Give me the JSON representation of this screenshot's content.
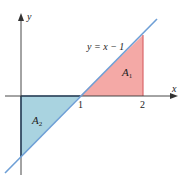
{
  "diagram": {
    "type": "area-under-line",
    "equation_label": "y = x − 1",
    "axes": {
      "x_label": "x",
      "y_label": "y",
      "x_ticks": [
        "1",
        "2"
      ]
    },
    "regions": [
      {
        "name": "A",
        "subscript": "1",
        "color": "#f4a9a6",
        "description": "area above x-axis between x=1 and x=2"
      },
      {
        "name": "A",
        "subscript": "2",
        "color": "#a9d3e0",
        "description": "area below x-axis between x=0 and x=1"
      }
    ],
    "colors": {
      "line": "#6e9fd6",
      "axis": "#333333",
      "region_a1_fill": "#f4a9a6",
      "region_a1_edge": "#d9676a",
      "region_a2_fill": "#a9d3e0",
      "region_a2_edge": "#2f5f8f"
    }
  }
}
